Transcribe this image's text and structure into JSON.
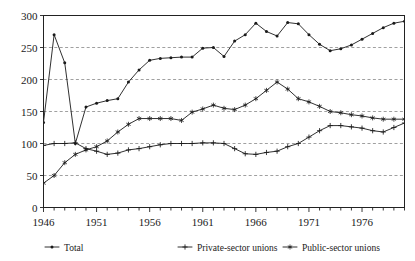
{
  "chart_data": {
    "type": "line",
    "title": "",
    "xlabel": "",
    "ylabel": "",
    "xlim": [
      1946,
      1980
    ],
    "ylim": [
      0,
      300
    ],
    "grid": true,
    "grid_axis": "y",
    "legend_position": "bottom",
    "ytick_labels": [
      "0",
      "50",
      "100",
      "150",
      "200",
      "250",
      "300"
    ],
    "ytick_values": [
      0,
      50,
      100,
      150,
      200,
      250,
      300
    ],
    "xtick_labels": [
      "1946",
      "1951",
      "1956",
      "1961",
      "1966",
      "1971",
      "1976"
    ],
    "xtick_values": [
      1946,
      1951,
      1956,
      1961,
      1966,
      1971,
      1976
    ],
    "x": [
      1946,
      1947,
      1948,
      1949,
      1950,
      1951,
      1952,
      1953,
      1954,
      1955,
      1956,
      1957,
      1958,
      1959,
      1960,
      1961,
      1962,
      1963,
      1964,
      1965,
      1966,
      1967,
      1968,
      1969,
      1970,
      1971,
      1972,
      1973,
      1974,
      1975,
      1976,
      1977,
      1978,
      1979,
      1980
    ],
    "series": [
      {
        "name": "Total",
        "marker": "dot",
        "values": [
          133,
          270,
          226,
          100,
          157,
          163,
          167,
          170,
          196,
          215,
          230,
          233,
          234,
          235,
          235,
          249,
          250,
          236,
          260,
          270,
          288,
          275,
          268,
          289,
          287,
          270,
          255,
          245,
          248,
          254,
          263,
          272,
          281,
          288,
          291
        ]
      },
      {
        "name": "Private-sector unions",
        "marker": "plus",
        "values": [
          97,
          100,
          100,
          101,
          92,
          88,
          83,
          85,
          90,
          92,
          95,
          98,
          100,
          100,
          100,
          101,
          101,
          100,
          92,
          84,
          83,
          86,
          88,
          95,
          100,
          110,
          120,
          128,
          128,
          126,
          124,
          120,
          118,
          125,
          132
        ]
      },
      {
        "name": "Public-sector unions",
        "marker": "star",
        "values": [
          38,
          50,
          70,
          83,
          90,
          95,
          104,
          118,
          130,
          139,
          139,
          139,
          139,
          136,
          149,
          154,
          160,
          155,
          153,
          160,
          170,
          183,
          196,
          185,
          170,
          165,
          158,
          150,
          148,
          145,
          143,
          140,
          138,
          138,
          138
        ]
      }
    ]
  },
  "legend": {
    "items": [
      {
        "label": "Total",
        "marker": "dot"
      },
      {
        "label": "Private-sector unions",
        "marker": "plus"
      },
      {
        "label": "Public-sector unions",
        "marker": "star"
      }
    ]
  },
  "page": {
    "cropped_header_text": ""
  }
}
